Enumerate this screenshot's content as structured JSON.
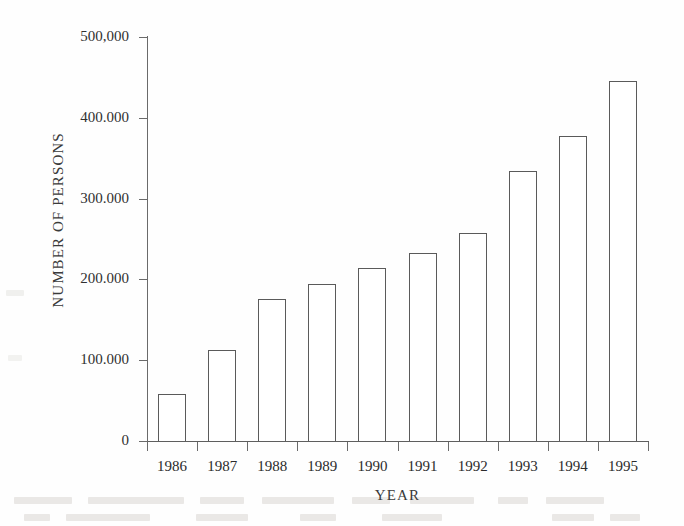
{
  "chart_data": {
    "type": "bar",
    "title": "",
    "xlabel": "YEAR",
    "ylabel": "NUMBER OF PERSONS",
    "categories": [
      "1986",
      "1987",
      "1988",
      "1989",
      "1990",
      "1991",
      "1992",
      "1993",
      "1994",
      "1995"
    ],
    "values": [
      58000,
      113000,
      176000,
      194000,
      214000,
      233000,
      258000,
      334000,
      378000,
      446000
    ],
    "ylim": [
      0,
      500000
    ],
    "y_ticks": [
      0,
      100000,
      200000,
      300000,
      400000,
      500000
    ],
    "y_tick_labels": [
      "0",
      "100.000",
      "200.000",
      "300.000",
      "400.000",
      "500,000"
    ],
    "grid": false,
    "legend": null,
    "bar_fill": "#ffffff",
    "bar_stroke": "#5a5a5a",
    "axis_color": "#6a6a6a",
    "background": "#fefefe"
  }
}
